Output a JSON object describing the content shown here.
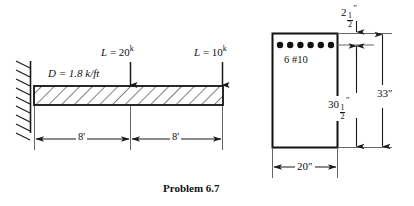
{
  "figure": {
    "caption": "Problem 6.7"
  },
  "beam_diagram": {
    "name": "cantilever-beam-loading-diagram",
    "support": "fixed-wall-support",
    "distributed_load": {
      "symbol": "D",
      "equals": "=",
      "value": "1.8 k/ft",
      "full_text": "D = 1.8 k/ft"
    },
    "point_loads": [
      {
        "symbol": "L",
        "equals": "=",
        "magnitude": "20",
        "unit_superscript": "k",
        "full_text": "L = 20k",
        "position": "midspan"
      },
      {
        "symbol": "L",
        "equals": "=",
        "magnitude": "10",
        "unit_superscript": "k",
        "full_text": "L = 10k",
        "position": "free-end"
      }
    ],
    "span_dimensions": [
      {
        "label": "8'",
        "segment": "left"
      },
      {
        "label": "8'",
        "segment": "right"
      }
    ]
  },
  "cross_section": {
    "name": "reinforced-concrete-cross-section",
    "reinforcement_label": "6  #10",
    "bar_count": 6,
    "dimensions": {
      "cover": {
        "whole": "2",
        "num": "1",
        "den": "2",
        "unit": "″"
      },
      "effective_depth": {
        "whole": "30",
        "num": "1",
        "den": "2",
        "unit": "″"
      },
      "total_depth": {
        "label": "33″"
      },
      "width": {
        "label": "20″"
      }
    }
  },
  "colors": {
    "ink": "#111111",
    "line": "#1a1a1a",
    "background": "#ffffff"
  }
}
